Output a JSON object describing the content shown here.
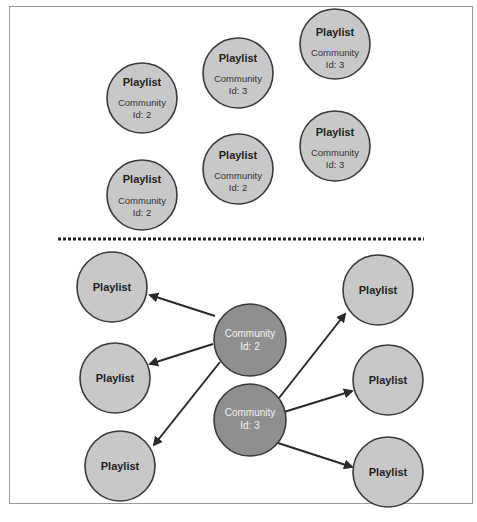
{
  "colors": {
    "playlist_fill": "#c8c8c8",
    "community_fill": "#8f8f8f",
    "stroke": "#3a3a3a",
    "divider": "#222222",
    "frame": "#9a9a9a"
  },
  "top_section": {
    "description": "Playlist nodes with community id property",
    "nodes": [
      {
        "title": "Playlist",
        "line1": "Community",
        "line2": "Id: 2"
      },
      {
        "title": "Playlist",
        "line1": "Community",
        "line2": "Id: 3"
      },
      {
        "title": "Playlist",
        "line1": "Community",
        "line2": "Id: 3"
      },
      {
        "title": "Playlist",
        "line1": "Community",
        "line2": "Id: 2"
      },
      {
        "title": "Playlist",
        "line1": "Community",
        "line2": "Id: 2"
      },
      {
        "title": "Playlist",
        "line1": "Community",
        "line2": "Id: 3"
      }
    ]
  },
  "bottom_section": {
    "description": "Community nodes linked to playlist nodes",
    "communities": [
      {
        "line1": "Community",
        "line2": "Id: 2"
      },
      {
        "line1": "Community",
        "line2": "Id: 3"
      }
    ],
    "playlists_left": [
      {
        "title": "Playlist"
      },
      {
        "title": "Playlist"
      },
      {
        "title": "Playlist"
      }
    ],
    "playlists_right": [
      {
        "title": "Playlist"
      },
      {
        "title": "Playlist"
      },
      {
        "title": "Playlist"
      }
    ],
    "edges": [
      {
        "from": "Community Id: 2",
        "to": "left playlist 1"
      },
      {
        "from": "Community Id: 2",
        "to": "left playlist 2"
      },
      {
        "from": "Community Id: 2",
        "to": "left playlist 3"
      },
      {
        "from": "Community Id: 3",
        "to": "right playlist 1"
      },
      {
        "from": "Community Id: 3",
        "to": "right playlist 2"
      },
      {
        "from": "Community Id: 3",
        "to": "right playlist 3"
      }
    ]
  }
}
